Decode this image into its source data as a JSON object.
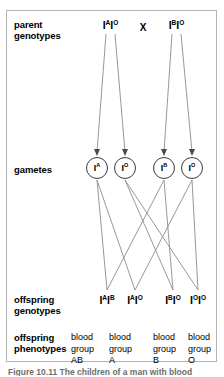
{
  "figure": {
    "title_caption": "Figure 10.11 The children of a man with blood",
    "cross_symbol": "X",
    "rows": [
      {
        "key": "parent",
        "label": "parent\ngenotypes"
      },
      {
        "key": "gametes",
        "label": "gametes"
      },
      {
        "key": "offspring_genotypes",
        "label": "offspring\ngenotypes"
      },
      {
        "key": "offspring_phenotypes",
        "label": "offspring\nphenotypes"
      }
    ],
    "row_labels": {
      "parent_line1": "parent",
      "parent_line2": "genotypes",
      "gametes": "gametes",
      "offspring_geno_line1": "offspring",
      "offspring_geno_line2": "genotypes",
      "offspring_pheno_line1": "offspring",
      "offspring_pheno_line2": "phenotypes"
    },
    "parents": [
      {
        "allele1": "I",
        "sup1": "A",
        "allele2": "I",
        "sup2": "O",
        "text": "IAIO"
      },
      {
        "allele1": "I",
        "sup1": "B",
        "allele2": "I",
        "sup2": "O",
        "text": "IBIO"
      }
    ],
    "gametes": [
      {
        "allele": "I",
        "sup": "A"
      },
      {
        "allele": "I",
        "sup": "O"
      },
      {
        "allele": "I",
        "sup": "B"
      },
      {
        "allele": "I",
        "sup": "O"
      }
    ],
    "offspring_genotypes": [
      {
        "a1": "I",
        "s1": "A",
        "a2": "I",
        "s2": "B"
      },
      {
        "a1": "I",
        "s1": "A",
        "a2": "I",
        "s2": "O"
      },
      {
        "a1": "I",
        "s1": "B",
        "a2": "I",
        "s2": "O"
      },
      {
        "a1": "I",
        "s1": "O",
        "a2": "I",
        "s2": "O"
      }
    ],
    "offspring_phenotypes": [
      {
        "line1": "blood",
        "line2": "group",
        "line3": "AB"
      },
      {
        "line1": "blood",
        "line2": "group",
        "line3": "A"
      },
      {
        "line1": "blood",
        "line2": "group",
        "line3": "B"
      },
      {
        "line1": "blood",
        "line2": "group",
        "line3": "O"
      }
    ],
    "colors": {
      "frame_border": "#b4b4b4",
      "line": "#8c8c8c",
      "circle_border": "#3c3c3c",
      "text": "#000000",
      "background": "#ffffff"
    }
  }
}
